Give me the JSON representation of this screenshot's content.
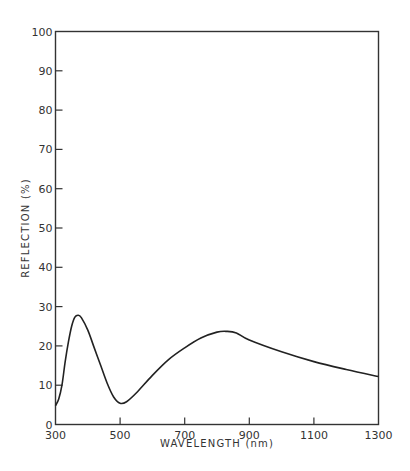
{
  "chart_data": {
    "type": "line",
    "title": "",
    "xlabel": "WAVELENGTH (nm)",
    "ylabel": "REFLECTION (%)",
    "xlim": [
      300,
      1300
    ],
    "ylim": [
      0,
      100
    ],
    "xticks": [
      300,
      500,
      700,
      900,
      1100,
      1300
    ],
    "yticks": [
      0,
      10,
      20,
      30,
      40,
      50,
      60,
      70,
      80,
      90,
      100
    ],
    "grid": false,
    "legend": null,
    "series": [
      {
        "name": "Reflection",
        "x": [
          300,
          310,
          320,
          330,
          340,
          350,
          360,
          370,
          380,
          400,
          420,
          440,
          460,
          480,
          500,
          520,
          550,
          600,
          650,
          700,
          750,
          800,
          830,
          860,
          900,
          1000,
          1100,
          1200,
          1300
        ],
        "values": [
          4.8,
          6.5,
          10,
          16,
          21,
          25,
          27.3,
          27.8,
          27.2,
          24,
          19.5,
          15,
          10.5,
          7,
          5.4,
          5.8,
          8,
          12.5,
          16.5,
          19.5,
          22,
          23.5,
          23.7,
          23.3,
          21.5,
          18.5,
          16,
          14,
          12.2
        ],
        "color": "#222222"
      }
    ]
  }
}
